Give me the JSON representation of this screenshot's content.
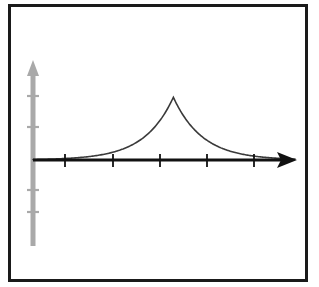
{
  "figure": {
    "title": "",
    "frame": {
      "border_color": "#1a1a1a",
      "background_color": "#ffffff",
      "x": 8,
      "y": 4,
      "width": 300,
      "height": 278
    }
  },
  "chart_data": {
    "type": "line",
    "title": "",
    "subtitle": "",
    "xlabel": "",
    "ylabel": "",
    "legend": [],
    "legend_position": "none",
    "grid": false,
    "annotations": [],
    "curve": {
      "name": "laplace-density",
      "color": "#3a3a3a",
      "line_width": 1.6,
      "peak_x": 3.0,
      "peak_y": 1.0,
      "decay_rate": 0.62,
      "xlim": [
        0,
        5.6
      ],
      "ylim": [
        0,
        1.18
      ],
      "x": [
        0.0,
        0.25,
        0.5,
        0.75,
        1.0,
        1.25,
        1.5,
        1.75,
        2.0,
        2.25,
        2.5,
        2.75,
        3.0,
        3.25,
        3.5,
        3.75,
        4.0,
        4.25,
        4.5,
        4.75,
        5.0,
        5.25,
        5.6
      ],
      "y": [
        0.155,
        0.181,
        0.212,
        0.247,
        0.289,
        0.338,
        0.395,
        0.461,
        0.539,
        0.629,
        0.735,
        0.858,
        1.0,
        0.858,
        0.735,
        0.629,
        0.539,
        0.461,
        0.395,
        0.338,
        0.289,
        0.247,
        0.204
      ]
    },
    "x_axis": {
      "color": "#111111",
      "line_width": 3,
      "arrow": true,
      "start_px": [
        33,
        160
      ],
      "end_px": [
        297,
        160
      ],
      "tick_count": 5,
      "tick_positions_px": [
        65,
        113,
        160,
        207,
        254
      ],
      "tick_labels": [
        "",
        "",
        "",
        "",
        ""
      ]
    },
    "y_axis": {
      "color": "#a9a9a9",
      "line_width": 5,
      "arrow": true,
      "start_px": [
        33,
        246
      ],
      "end_px": [
        33,
        62
      ],
      "tick_count": 5,
      "tick_positions_px": [
        96,
        127,
        160,
        190,
        212
      ],
      "tick_labels": [
        "",
        "",
        "",
        "",
        ""
      ]
    }
  }
}
